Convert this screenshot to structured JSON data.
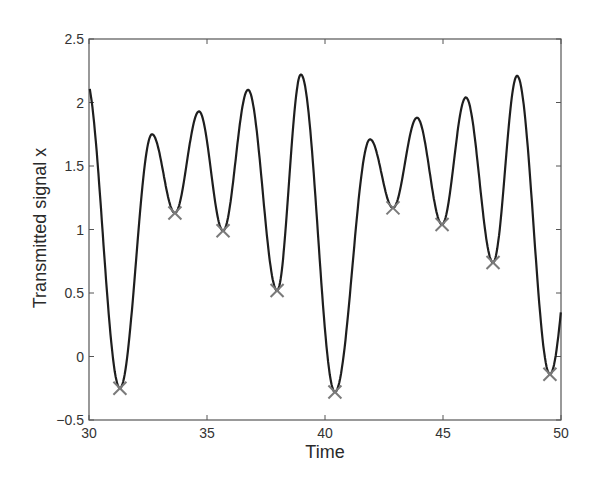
{
  "chart_data": {
    "type": "line",
    "title": "",
    "xlabel": "Time",
    "ylabel": "Transmitted signal x",
    "xlim": [
      30,
      50
    ],
    "ylim": [
      -0.5,
      2.5
    ],
    "xticks": [
      30,
      35,
      40,
      45,
      50
    ],
    "xtick_labels": [
      "30",
      "35",
      "40",
      "45",
      "50"
    ],
    "yticks": [
      -0.5,
      0,
      0.5,
      1,
      1.5,
      2,
      2.5
    ],
    "ytick_labels": [
      "−0.5",
      "0",
      "0.5",
      "1",
      "1.5",
      "2",
      "2.5"
    ],
    "grid": false,
    "legend": null,
    "series": [
      {
        "name": "signal",
        "style": "solid line",
        "color": "#1e1e1e",
        "extrema": [
          {
            "t": 29.85,
            "v": 2.2
          },
          {
            "t": 31.31,
            "v": -0.25
          },
          {
            "t": 32.67,
            "v": 1.75
          },
          {
            "t": 33.64,
            "v": 1.13
          },
          {
            "t": 34.66,
            "v": 1.93
          },
          {
            "t": 35.68,
            "v": 0.99
          },
          {
            "t": 36.74,
            "v": 2.1
          },
          {
            "t": 37.97,
            "v": 0.52
          },
          {
            "t": 38.98,
            "v": 2.22
          },
          {
            "t": 40.42,
            "v": -0.28
          },
          {
            "t": 41.91,
            "v": 1.71
          },
          {
            "t": 42.88,
            "v": 1.17
          },
          {
            "t": 43.9,
            "v": 1.88
          },
          {
            "t": 44.96,
            "v": 1.04
          },
          {
            "t": 45.97,
            "v": 2.04
          },
          {
            "t": 47.12,
            "v": 0.74
          },
          {
            "t": 48.14,
            "v": 2.21
          },
          {
            "t": 49.53,
            "v": -0.14
          },
          {
            "t": 50.95,
            "v": 1.9
          }
        ]
      },
      {
        "name": "local minima",
        "style": "x markers",
        "color": "#7a7a7a",
        "points": [
          {
            "t": 31.31,
            "v": -0.25
          },
          {
            "t": 33.64,
            "v": 1.13
          },
          {
            "t": 35.68,
            "v": 0.99
          },
          {
            "t": 37.97,
            "v": 0.52
          },
          {
            "t": 40.42,
            "v": -0.28
          },
          {
            "t": 42.88,
            "v": 1.17
          },
          {
            "t": 44.96,
            "v": 1.04
          },
          {
            "t": 47.12,
            "v": 0.74
          },
          {
            "t": 49.53,
            "v": -0.14
          }
        ]
      }
    ]
  }
}
